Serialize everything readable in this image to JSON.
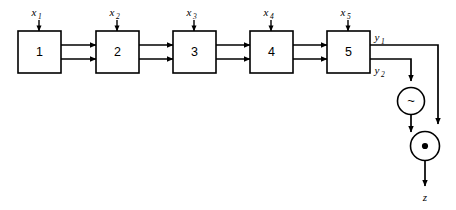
{
  "diagram": {
    "canvas": {
      "width": 456,
      "height": 210,
      "background": "#ffffff",
      "ink": "#000000"
    },
    "blocks": [
      {
        "id": "b1",
        "label": "1",
        "x": 18,
        "y": 31,
        "w": 43,
        "h": 42,
        "input_label": "x",
        "input_sub": "1"
      },
      {
        "id": "b2",
        "label": "2",
        "x": 96,
        "y": 31,
        "w": 43,
        "h": 42,
        "input_label": "x",
        "input_sub": "2"
      },
      {
        "id": "b3",
        "label": "3",
        "x": 173,
        "y": 31,
        "w": 43,
        "h": 42,
        "input_label": "x",
        "input_sub": "3"
      },
      {
        "id": "b4",
        "label": "4",
        "x": 250,
        "y": 31,
        "w": 43,
        "h": 42,
        "input_label": "x",
        "input_sub": "4"
      },
      {
        "id": "b5",
        "label": "5",
        "x": 327,
        "y": 31,
        "w": 43,
        "h": 42,
        "input_label": "x",
        "input_sub": "5"
      }
    ],
    "input_arrows": [
      {
        "name": "input-arrow-x1",
        "x": 39,
        "y_from": 20,
        "y_to": 31
      },
      {
        "name": "input-arrow-x2",
        "x": 117,
        "y_from": 20,
        "y_to": 31
      },
      {
        "name": "input-arrow-x3",
        "x": 194,
        "y_from": 20,
        "y_to": 31
      },
      {
        "name": "input-arrow-x4",
        "x": 271,
        "y_from": 20,
        "y_to": 31
      },
      {
        "name": "input-arrow-x5",
        "x": 348,
        "y_from": 20,
        "y_to": 31
      }
    ],
    "input_label_positions": [
      {
        "x": 36,
        "y": 15
      },
      {
        "x": 114,
        "y": 15
      },
      {
        "x": 191,
        "y": 15
      },
      {
        "x": 268,
        "y": 15
      },
      {
        "x": 345,
        "y": 15
      }
    ],
    "bus_links": [
      {
        "name": "bus-1-to-2",
        "x_from": 61,
        "x_to": 96,
        "rows": [
          45,
          59
        ]
      },
      {
        "name": "bus-2-to-3",
        "x_from": 139,
        "x_to": 173,
        "rows": [
          45,
          59
        ]
      },
      {
        "name": "bus-3-to-4",
        "x_from": 216,
        "x_to": 250,
        "rows": [
          45,
          59
        ]
      },
      {
        "name": "bus-4-to-5",
        "x_from": 293,
        "x_to": 327,
        "rows": [
          45,
          59
        ]
      }
    ],
    "outputs": [
      {
        "id": "y1",
        "label": "y",
        "sub": "1",
        "label_x": 374,
        "label_y": 41,
        "row_y": 45
      },
      {
        "id": "y2",
        "label": "y",
        "sub": "2",
        "label_x": 374,
        "label_y": 74,
        "row_y": 59
      }
    ],
    "gates": [
      {
        "id": "not-gate",
        "glyph": "~",
        "glyph_name": "tilde-glyph",
        "cx": 411,
        "cy": 101,
        "r": 13.5
      },
      {
        "id": "and-gate",
        "glyph": "•",
        "glyph_name": "dot-glyph",
        "cx": 425,
        "cy": 146,
        "r": 14.5
      }
    ],
    "final_output": {
      "label": "z",
      "x": 425,
      "y": 199,
      "arrow_from_y": 161,
      "arrow_to_y": 186
    },
    "routing": {
      "y1_run_x": 438,
      "y2_drop_x": 411,
      "note": "y1 routes right along row 45 to x=438, drops to the AND gate; y2 routes right along row 59 to x=411, drops into the NOT gate; NOT output drops into the AND gate."
    }
  }
}
